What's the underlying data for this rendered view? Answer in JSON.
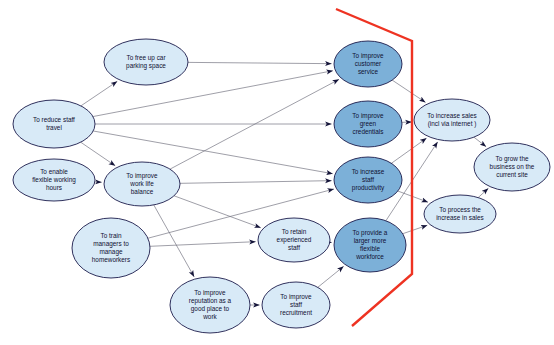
{
  "diagram": {
    "type": "causal-map",
    "title": "",
    "background_color": "#ffffff",
    "colors": {
      "node_light": "#d8eaf7",
      "node_dark": "#7cb0d8",
      "node_stroke": "#1b1b4b",
      "edge": "#6b6b78",
      "boundary": "#ee3322",
      "label_text": "#101033"
    },
    "boundary": {
      "name": "system-boundary",
      "color": "#ee3322",
      "points": "336,9 412,41 412,274 352,326"
    },
    "nodes": [
      {
        "id": "free-up-car-parking-space",
        "label": "To free up car\nparking space",
        "cx": 146,
        "cy": 62,
        "rx": 42,
        "ry": 23,
        "fill": "light"
      },
      {
        "id": "reduce-staff-travel",
        "label": "To reduce staff\ntravel",
        "cx": 54,
        "cy": 124,
        "rx": 41,
        "ry": 24,
        "fill": "light"
      },
      {
        "id": "enable-flexible-working-hours",
        "label": "To enable\nflexible working\nhours",
        "cx": 54,
        "cy": 180,
        "rx": 41,
        "ry": 21,
        "fill": "light"
      },
      {
        "id": "improve-work-life-balance",
        "label": "To improve\nwork life\nbalance",
        "cx": 142,
        "cy": 184,
        "rx": 38,
        "ry": 22,
        "fill": "light"
      },
      {
        "id": "train-managers-to-manage-homeworkers",
        "label": "To train\nmanagers to\nmanage\nhomeworkers",
        "cx": 111,
        "cy": 248,
        "rx": 39,
        "ry": 30,
        "fill": "light"
      },
      {
        "id": "improve-reputation-as-good-place-to-work",
        "label": "To improve\nreputation as a\ngood place to\nwork",
        "cx": 210,
        "cy": 305,
        "rx": 40,
        "ry": 28,
        "fill": "light"
      },
      {
        "id": "improve-staff-recruitment",
        "label": "To improve\nstaff\nrecruitment",
        "cx": 296,
        "cy": 305,
        "rx": 34,
        "ry": 23,
        "fill": "light"
      },
      {
        "id": "retain-experienced-staff",
        "label": "To retain\nexperienced\nstaff",
        "cx": 294,
        "cy": 240,
        "rx": 36,
        "ry": 22,
        "fill": "light"
      },
      {
        "id": "improve-customer-service",
        "label": "To improve\ncustomer\nservice",
        "cx": 368,
        "cy": 64,
        "rx": 34,
        "ry": 23,
        "fill": "dark"
      },
      {
        "id": "improve-green-credentials",
        "label": "To improve\ngreen\ncredentials",
        "cx": 368,
        "cy": 124,
        "rx": 34,
        "ry": 23,
        "fill": "dark"
      },
      {
        "id": "increase-staff-productivity",
        "label": "To increase\nstaff\nproductivity",
        "cx": 368,
        "cy": 180,
        "rx": 34,
        "ry": 23,
        "fill": "dark"
      },
      {
        "id": "provide-larger-more-flexible-workforce",
        "label": "To provide a\nlarger more\nflexible\nworkforce",
        "cx": 370,
        "cy": 245,
        "rx": 36,
        "ry": 27,
        "fill": "dark"
      },
      {
        "id": "increase-sales-incl-via-internet",
        "label": "To increase sales\n(incl via internet )",
        "cx": 452,
        "cy": 120,
        "rx": 38,
        "ry": 21,
        "fill": "light"
      },
      {
        "id": "grow-the-business-on-the-current-site",
        "label": "To grow the\nbusiness on the\ncurrent site",
        "cx": 512,
        "cy": 167,
        "rx": 38,
        "ry": 24,
        "fill": "light"
      },
      {
        "id": "process-the-increase-in-sales",
        "label": "To process the\nincrease in sales",
        "cx": 460,
        "cy": 214,
        "rx": 36,
        "ry": 19,
        "fill": "light"
      }
    ],
    "edges": [
      {
        "from": "reduce-staff-travel",
        "to": "free-up-car-parking-space"
      },
      {
        "from": "reduce-staff-travel",
        "to": "improve-customer-service"
      },
      {
        "from": "reduce-staff-travel",
        "to": "improve-green-credentials"
      },
      {
        "from": "reduce-staff-travel",
        "to": "improve-work-life-balance"
      },
      {
        "from": "reduce-staff-travel",
        "to": "increase-staff-productivity"
      },
      {
        "from": "free-up-car-parking-space",
        "to": "improve-customer-service"
      },
      {
        "from": "enable-flexible-working-hours",
        "to": "improve-work-life-balance"
      },
      {
        "from": "improve-work-life-balance",
        "to": "improve-customer-service"
      },
      {
        "from": "improve-work-life-balance",
        "to": "increase-staff-productivity"
      },
      {
        "from": "improve-work-life-balance",
        "to": "retain-experienced-staff"
      },
      {
        "from": "improve-work-life-balance",
        "to": "improve-reputation-as-good-place-to-work"
      },
      {
        "from": "train-managers-to-manage-homeworkers",
        "to": "increase-staff-productivity"
      },
      {
        "from": "train-managers-to-manage-homeworkers",
        "to": "retain-experienced-staff"
      },
      {
        "from": "improve-reputation-as-good-place-to-work",
        "to": "improve-staff-recruitment"
      },
      {
        "from": "improve-staff-recruitment",
        "to": "provide-larger-more-flexible-workforce"
      },
      {
        "from": "retain-experienced-staff",
        "to": "provide-larger-more-flexible-workforce"
      },
      {
        "from": "improve-customer-service",
        "to": "increase-sales-incl-via-internet"
      },
      {
        "from": "improve-green-credentials",
        "to": "increase-sales-incl-via-internet"
      },
      {
        "from": "increase-staff-productivity",
        "to": "increase-sales-incl-via-internet"
      },
      {
        "from": "increase-staff-productivity",
        "to": "process-the-increase-in-sales"
      },
      {
        "from": "provide-larger-more-flexible-workforce",
        "to": "increase-sales-incl-via-internet"
      },
      {
        "from": "provide-larger-more-flexible-workforce",
        "to": "process-the-increase-in-sales"
      },
      {
        "from": "increase-sales-incl-via-internet",
        "to": "grow-the-business-on-the-current-site"
      },
      {
        "from": "process-the-increase-in-sales",
        "to": "grow-the-business-on-the-current-site"
      }
    ]
  }
}
